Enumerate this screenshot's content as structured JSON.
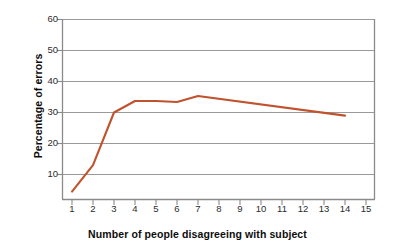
{
  "chart_data": {
    "type": "line",
    "title": "",
    "xlabel": "Number of people disagreeing with subject",
    "ylabel": "Percentage of errors",
    "xlim": [
      0.5,
      15.5
    ],
    "ylim": [
      0,
      60
    ],
    "grid": "horizontal",
    "legend": "none",
    "line_color": "#c0522d",
    "grid_color": "#9a9a9a",
    "axis_color": "#8a8a8a",
    "background": "#ffffff",
    "x_ticks": [
      1,
      2,
      3,
      4,
      5,
      6,
      7,
      8,
      9,
      10,
      11,
      12,
      13,
      14,
      15
    ],
    "x_tick_labels": [
      "1",
      "2",
      "3",
      "4",
      "5",
      "6",
      "7",
      "8",
      "9",
      "10",
      "11",
      "12",
      "13",
      "14",
      "15"
    ],
    "y_ticks": [
      10,
      20,
      30,
      40,
      50,
      60
    ],
    "y_tick_labels": [
      "10",
      "20",
      "30",
      "40",
      "50",
      "60"
    ],
    "series": [
      {
        "name": "Percentage of errors",
        "color": "#c0522d",
        "x": [
          1,
          2,
          3,
          4,
          5,
          6,
          7,
          14
        ],
        "values": [
          4.5,
          13.0,
          30.0,
          33.7,
          33.7,
          33.4,
          35.3,
          29.0
        ]
      }
    ]
  }
}
